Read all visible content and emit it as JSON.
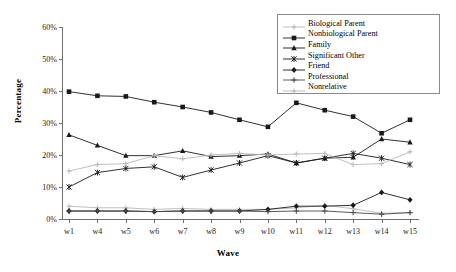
{
  "chart_data": {
    "type": "line",
    "title": "",
    "xlabel": "Wave",
    "ylabel": "Percentage",
    "grid": false,
    "legend_position": "top-right",
    "categories": [
      "w1",
      "w4",
      "w5",
      "w6",
      "w7",
      "w8",
      "w9",
      "w10",
      "w11",
      "w12",
      "w13",
      "w14",
      "w15"
    ],
    "ylim": [
      0,
      60
    ],
    "yticks": [
      "0%",
      "10%",
      "20%",
      "30%",
      "40%",
      "50%",
      "60%"
    ],
    "ytick_values": [
      0,
      10,
      20,
      30,
      40,
      50,
      60
    ],
    "series": [
      {
        "name": "Biological Parent",
        "marker": "cross-light",
        "color": "#b9b9b9",
        "values": [
          4.0,
          3.5,
          3.5,
          3.0,
          3.3,
          3.0,
          3.0,
          3.0,
          3.5,
          4.3,
          3.2,
          1.8,
          2.0
        ]
      },
      {
        "name": "Nonbiological Parent",
        "marker": "square",
        "color": "#1a1a1a",
        "values": [
          39.8,
          38.5,
          38.3,
          36.5,
          35.0,
          33.3,
          31.0,
          28.8,
          36.3,
          34.0,
          32.0,
          26.8,
          31.0
        ]
      },
      {
        "name": "Family",
        "marker": "triangle",
        "color": "#1a1a1a",
        "values": [
          26.3,
          23.0,
          19.8,
          19.8,
          21.3,
          19.5,
          19.8,
          20.3,
          17.5,
          19.0,
          19.3,
          25.0,
          24.0
        ]
      },
      {
        "name": "Significant Other",
        "marker": "asterisk",
        "color": "#1a1a1a",
        "values": [
          10.0,
          14.5,
          15.8,
          16.3,
          13.0,
          15.3,
          17.5,
          19.8,
          17.5,
          19.0,
          20.5,
          19.0,
          17.0
        ]
      },
      {
        "name": "Friend",
        "marker": "diamond",
        "color": "#1a1a1a",
        "values": [
          2.5,
          2.5,
          2.5,
          2.3,
          2.5,
          2.5,
          2.5,
          3.0,
          4.0,
          4.0,
          4.3,
          8.3,
          6.0
        ]
      },
      {
        "name": "Professional",
        "marker": "plus",
        "color": "#4a4a4a",
        "values": [
          2.5,
          2.5,
          2.5,
          2.3,
          2.5,
          2.5,
          2.5,
          2.3,
          2.5,
          2.5,
          2.0,
          1.5,
          2.0
        ]
      },
      {
        "name": "Nonrelative",
        "marker": "cross-light2",
        "color": "#b9b9b9",
        "values": [
          15.0,
          17.0,
          17.3,
          19.8,
          18.8,
          20.0,
          20.5,
          20.0,
          20.3,
          20.5,
          17.0,
          17.3,
          21.0
        ]
      }
    ]
  }
}
